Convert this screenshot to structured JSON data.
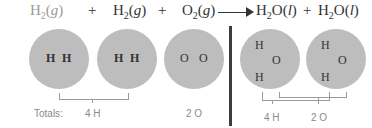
{
  "equation": {
    "reactants": [
      {
        "formula_main": "H",
        "subscript": "2",
        "state": "(g)",
        "faded": true
      },
      {
        "formula_main": "H",
        "subscript": "2",
        "state": "(g)",
        "faded": false
      },
      {
        "formula_main": "O",
        "subscript": "2",
        "state": "(g)",
        "faded": false
      }
    ],
    "products": [
      {
        "formula_h": "H",
        "subscript": "2",
        "formula_o": "O",
        "state": "(l)"
      },
      {
        "formula_h": "H",
        "subscript": "2",
        "formula_o": "O",
        "state": "(l)"
      }
    ],
    "plus": "+"
  },
  "molecules": {
    "left": [
      {
        "atoms": [
          "H",
          "H"
        ]
      },
      {
        "atoms": [
          "H",
          "H"
        ]
      },
      {
        "atoms": [
          "O",
          "O"
        ]
      }
    ],
    "right": [
      {
        "atoms": [
          "H",
          "O",
          "H"
        ]
      },
      {
        "atoms": [
          "H",
          "O",
          "H"
        ]
      }
    ]
  },
  "totals": {
    "label": "Totals:",
    "left_h": "4 H",
    "left_o": "2 O",
    "right_h": "4 H",
    "right_o": "2 O"
  },
  "colors": {
    "circle": "#bdbdbd",
    "divider": "#3d3d3d",
    "bracket": "#9a9a9a"
  }
}
